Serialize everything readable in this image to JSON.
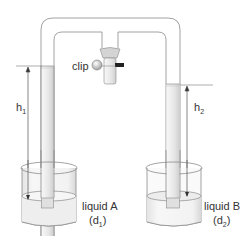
{
  "diagram": {
    "type": "hare-apparatus",
    "labels": {
      "clip": "clip",
      "h1": "h",
      "h1_sub": "1",
      "h2": "h",
      "h2_sub": "2",
      "liquidA": "liquid A",
      "d1_open": "(d",
      "d1_sub": "1",
      "d1_close": ")",
      "liquidB": "liquid B",
      "d2_open": "(d",
      "d2_sub": "2",
      "d2_close": ")"
    },
    "colors": {
      "line": "#8a8a8a",
      "dark": "#333333",
      "liquid": "#ececec",
      "tube_fill": "#f4f4f4"
    }
  }
}
